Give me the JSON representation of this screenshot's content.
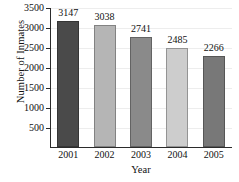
{
  "chart_data": {
    "type": "bar",
    "title": "",
    "subtitle": "",
    "xlabel": "Year",
    "ylabel": "Number of Inmates",
    "categories": [
      "2001",
      "2002",
      "2003",
      "2004",
      "2005"
    ],
    "values": [
      3147,
      3038,
      2741,
      2485,
      2266
    ],
    "data_labels": [
      "3147",
      "3038",
      "2741",
      "2485",
      "2266"
    ],
    "series": [
      {
        "name": "Number of Inmates",
        "values": [
          3147,
          3038,
          2741,
          2485,
          2266
        ]
      }
    ],
    "ylim": [
      0,
      3500
    ],
    "xlim": [
      0,
      5
    ],
    "yticks": [
      500,
      1000,
      1500,
      2000,
      2500,
      3000,
      3500
    ],
    "ytick_labels": [
      "500",
      "1000",
      "1500",
      "2000",
      "2500",
      "3000",
      "3500"
    ],
    "grid": true,
    "grid_axis": "y",
    "legend": false,
    "legend_position": "none",
    "bar_colors": [
      "#4a4a4a",
      "#b5b5b5",
      "#8a8a8a",
      "#cdcdcd",
      "#787878"
    ],
    "background_color": "#ffffff",
    "axis_color": "#2b2b2b",
    "gridline_color": "#ededed",
    "text_color": "#111111"
  }
}
